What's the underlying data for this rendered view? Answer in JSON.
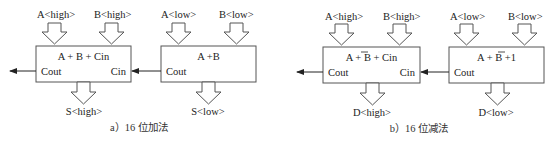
{
  "diagram_a": {
    "caption": "a）16 位加法",
    "high_block": {
      "input_a": "A<high>",
      "input_b": "B<high>",
      "operation": "A + B + Cin",
      "cout": "Cout",
      "cin": "Cin",
      "output": "S<high>"
    },
    "low_block": {
      "input_a": "A<low>",
      "input_b": "B<low>",
      "operation": "A +B",
      "cout": "Cout",
      "output": "S<low>"
    }
  },
  "diagram_b": {
    "caption": "b）16 位减法",
    "high_block": {
      "input_a": "A<high>",
      "input_b": "B<high>",
      "op_a": "A + ",
      "op_b": "B",
      "op_c": " + Cin",
      "cout": "Cout",
      "cin": "Cin",
      "output": "D<high>"
    },
    "low_block": {
      "input_a": "A<low>",
      "input_b": "B<low>",
      "op_a": "A + ",
      "op_b": "B",
      "op_c": " +1",
      "cout": "Cout",
      "output": "D<low>"
    }
  },
  "colors": {
    "stroke": "#555555",
    "text": "#222222",
    "background": "#ffffff"
  }
}
